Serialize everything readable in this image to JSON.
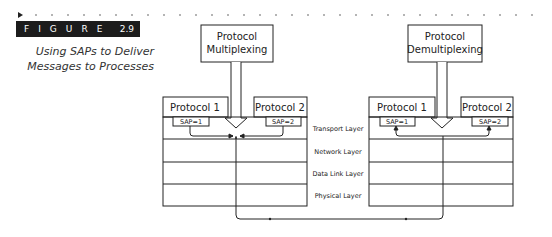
{
  "figure": {
    "label": "FIGURE",
    "number": "2.9",
    "caption_line1": "Using SAPs to Deliver",
    "caption_line2": "Messages to Processes"
  },
  "left_stack": {
    "header_title_line1": "Protocol",
    "header_title_line2": "Multiplexing",
    "protocol_1": "Protocol 1",
    "protocol_2": "Protocol 2",
    "sap_1": "SAP=1",
    "sap_2": "SAP=2"
  },
  "right_stack": {
    "header_title_line1": "Protocol",
    "header_title_line2": "Demultiplexing",
    "protocol_1": "Protocol 1",
    "protocol_2": "Protocol 2",
    "sap_1": "SAP=1",
    "sap_2": "SAP=2"
  },
  "layers": [
    {
      "label": "Transport Layer"
    },
    {
      "label": "Network Layer"
    },
    {
      "label": "Data Link Layer"
    },
    {
      "label": "Physical Layer"
    }
  ],
  "colors": {
    "line": "#222222",
    "figure_bar": "#1c1c1c",
    "background": "#ffffff"
  }
}
